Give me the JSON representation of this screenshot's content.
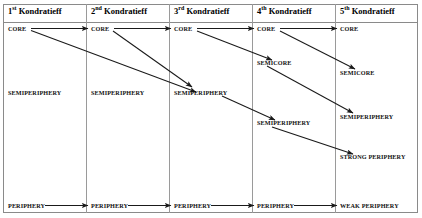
{
  "diagram": {
    "columns": [
      {
        "id": "k1",
        "ordinal": "1",
        "suffix": "st",
        "name": "Kondratieff",
        "header": "1st Kondratieff"
      },
      {
        "id": "k2",
        "ordinal": "2",
        "suffix": "nd",
        "name": "Kondratieff",
        "header": "2nd Kondratieff"
      },
      {
        "id": "k3",
        "ordinal": "3",
        "suffix": "rd",
        "name": "Kondratieff",
        "header": "3rd Kondratieff"
      },
      {
        "id": "k4",
        "ordinal": "4",
        "suffix": "th",
        "name": "Kondratieff",
        "header": "4th Kondratieff"
      },
      {
        "id": "k5",
        "ordinal": "5",
        "suffix": "th",
        "name": "Kondratieff",
        "header": "5th Kondratieff"
      }
    ],
    "nodes": [
      {
        "id": "k1-core",
        "column": "k1",
        "label": "CORE"
      },
      {
        "id": "k1-semiperiphery",
        "column": "k1",
        "label": "SEMIPERIPHERY"
      },
      {
        "id": "k1-periphery",
        "column": "k1",
        "label": "PERIPHERY"
      },
      {
        "id": "k2-core",
        "column": "k2",
        "label": "CORE"
      },
      {
        "id": "k2-semiperiphery",
        "column": "k2",
        "label": "SEMIPERIPHERY"
      },
      {
        "id": "k2-periphery",
        "column": "k2",
        "label": "PERIPHERY"
      },
      {
        "id": "k3-core",
        "column": "k3",
        "label": "CORE"
      },
      {
        "id": "k3-semiperiphery",
        "column": "k3",
        "label": "SEMIPERIPHERY"
      },
      {
        "id": "k3-periphery",
        "column": "k3",
        "label": "PERIPHERY"
      },
      {
        "id": "k4-core",
        "column": "k4",
        "label": "CORE"
      },
      {
        "id": "k4-semicore",
        "column": "k4",
        "label": "SEMICORE"
      },
      {
        "id": "k4-semiperiphery",
        "column": "k4",
        "label": "SEMIPERIPHERY"
      },
      {
        "id": "k4-periphery",
        "column": "k4",
        "label": "PERIPHERY"
      },
      {
        "id": "k5-core",
        "column": "k5",
        "label": "CORE"
      },
      {
        "id": "k5-semicore",
        "column": "k5",
        "label": "SEMICORE"
      },
      {
        "id": "k5-semiperiphery",
        "column": "k5",
        "label": "SEMIPERIPHERY"
      },
      {
        "id": "k5-strong-periphery",
        "column": "k5",
        "label": "STRONG PERIPHERY"
      },
      {
        "id": "k5-weak-periphery",
        "column": "k5",
        "label": "WEAK PERIPHERY"
      }
    ],
    "arrows": [
      {
        "id": "a1",
        "from": "k1-core",
        "to": "k2-core",
        "kind": "horizontal"
      },
      {
        "id": "a2",
        "from": "k2-core",
        "to": "k3-core",
        "kind": "horizontal"
      },
      {
        "id": "a3",
        "from": "k3-core",
        "to": "k4-core",
        "kind": "horizontal"
      },
      {
        "id": "a4",
        "from": "k4-core",
        "to": "k5-core",
        "kind": "horizontal"
      },
      {
        "id": "a5",
        "from": "k1-core",
        "to": "k3-semiperiphery",
        "kind": "diagonal"
      },
      {
        "id": "a6",
        "from": "k2-core",
        "to": "k3-semiperiphery",
        "kind": "diagonal"
      },
      {
        "id": "a7",
        "from": "k3-core",
        "to": "k4-semicore",
        "kind": "diagonal"
      },
      {
        "id": "a8",
        "from": "k3-semiperiphery",
        "to": "k4-semiperiphery",
        "kind": "diagonal"
      },
      {
        "id": "a9",
        "from": "k4-core",
        "to": "k5-semicore",
        "kind": "diagonal"
      },
      {
        "id": "a10",
        "from": "k4-semicore",
        "to": "k5-semiperiphery",
        "kind": "diagonal"
      },
      {
        "id": "a11",
        "from": "k4-semiperiphery",
        "to": "k5-strong-periphery",
        "kind": "diagonal"
      },
      {
        "id": "a12",
        "from": "k1-periphery",
        "to": "k2-periphery",
        "kind": "horizontal"
      },
      {
        "id": "a13",
        "from": "k2-periphery",
        "to": "k3-periphery",
        "kind": "horizontal"
      },
      {
        "id": "a14",
        "from": "k3-periphery",
        "to": "k4-periphery",
        "kind": "horizontal"
      },
      {
        "id": "a15",
        "from": "k4-periphery",
        "to": "k5-weak-periphery",
        "kind": "horizontal"
      }
    ],
    "colors": {
      "background": "#ffffff",
      "border": "#8a8a8a",
      "divider": "#9a9a9a",
      "text": "#000000",
      "arrow": "#1a1a1a"
    }
  }
}
